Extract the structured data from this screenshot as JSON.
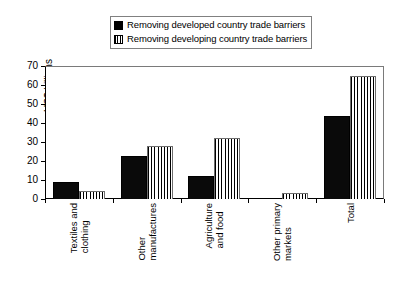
{
  "chart_data": {
    "type": "bar",
    "title": "",
    "subtitle": "",
    "xlabel": "",
    "ylabel": "US$ billions",
    "ylim": [
      0,
      70
    ],
    "yticks": [
      0,
      10,
      20,
      30,
      40,
      50,
      60,
      70
    ],
    "ytick_labels": [
      "0",
      "10",
      "20",
      "30",
      "40",
      "50",
      "60",
      "70"
    ],
    "grid": false,
    "legend_position": "top-center",
    "categories": [
      "Textiles and clothing",
      "Other manufactures",
      "Agriculture and food",
      "Other primary markets",
      "Total"
    ],
    "category_lines": [
      [
        "Textiles and",
        "clothing"
      ],
      [
        "Other",
        "manufactures"
      ],
      [
        "Agriculture",
        "and food"
      ],
      [
        "Other primary",
        "markets"
      ],
      [
        "Total",
        ""
      ]
    ],
    "series": [
      {
        "name": "Removing developed country trade barriers",
        "pattern": "solid-black",
        "color": "#000000",
        "values": [
          9,
          22.5,
          12,
          0.2,
          43.5
        ]
      },
      {
        "name": "Removing developing country trade barriers",
        "pattern": "vertical-stripes",
        "color": "#ffffff",
        "values": [
          4,
          28,
          32,
          3,
          65
        ]
      }
    ]
  },
  "legend": {
    "items": [
      {
        "label": "Removing developed country trade barriers",
        "swatch": "solid-black-swatch"
      },
      {
        "label": "Removing developing country trade barriers",
        "swatch": "vertical-stripe-swatch"
      }
    ]
  },
  "axis": {
    "y_title": "US$ billions"
  }
}
